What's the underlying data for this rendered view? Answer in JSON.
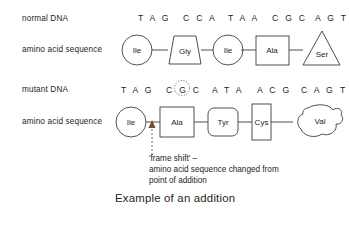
{
  "caption": "Example of an addition",
  "rows": {
    "normal": {
      "dna_label": "normal DNA",
      "protein_label": "amino acid sequence",
      "codons": [
        "T A G",
        "C C A",
        "T A A",
        "C G C",
        "A G T"
      ],
      "amino_acids": [
        {
          "name": "Ile",
          "shape": "circle"
        },
        {
          "name": "Gly",
          "shape": "trapezoid"
        },
        {
          "name": "Ile",
          "shape": "circle"
        },
        {
          "name": "Ala",
          "shape": "square"
        },
        {
          "name": "Ser",
          "shape": "triangle"
        }
      ]
    },
    "mutant": {
      "dna_label": "mutant DNA",
      "protein_label": "amino acid sequence",
      "codons": [
        "T A G",
        "C G C",
        "A T A",
        "A C G",
        "C A G",
        "T"
      ],
      "inserted_base": "G",
      "amino_acids": [
        {
          "name": "Ile",
          "shape": "circle"
        },
        {
          "name": "Ala",
          "shape": "square"
        },
        {
          "name": "Tyr",
          "shape": "rounded-square"
        },
        {
          "name": "Cys",
          "shape": "tall-rectangle"
        },
        {
          "name": "Val",
          "shape": "blob"
        }
      ]
    }
  },
  "annotation": {
    "line1": "'frame shift' –",
    "line2": "amino acid sequence changed from",
    "line3": "point of addition"
  },
  "colors": {
    "ink": "#231f20",
    "stroke": "#3c3c3c",
    "dotted": "#6b6b6b",
    "arrow": "#7a4a3a",
    "background": "#ffffff"
  }
}
